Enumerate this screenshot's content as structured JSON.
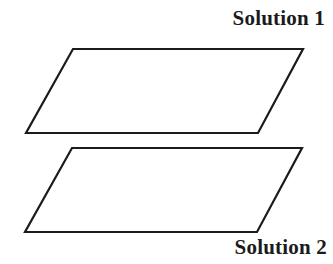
{
  "figure": {
    "background_color": "#ffffff",
    "stroke_color": "#1b1b1b",
    "stroke_width": 2.2,
    "width": 333,
    "height": 264
  },
  "labels": {
    "top": "Solution 1",
    "bottom": "Solution 2",
    "color": "#1b1b1b"
  },
  "shapes": {
    "parallelogram_top": {
      "name": "Solution 1",
      "points": "73,49 303,49 258,133 26,133",
      "fill": "none"
    },
    "parallelogram_bottom": {
      "name": "Solution 2",
      "points": "72,148 302,148 257,232 25,232",
      "fill": "none"
    }
  }
}
